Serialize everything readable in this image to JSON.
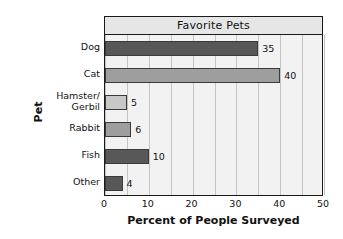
{
  "chart_data": {
    "type": "bar",
    "orientation": "horizontal",
    "title": "Favorite Pets",
    "xlabel": "Percent of People Surveyed",
    "ylabel": "Pet",
    "categories": [
      "Dog",
      "Cat",
      "Hamster/\nGerbil",
      "Rabbit",
      "Fish",
      "Other"
    ],
    "category_lines": [
      [
        "Dog"
      ],
      [
        "Cat"
      ],
      [
        "Hamster/",
        "Gerbil"
      ],
      [
        "Rabbit"
      ],
      [
        "Fish"
      ],
      [
        "Other"
      ]
    ],
    "values": [
      35,
      40,
      5,
      6,
      10,
      4
    ],
    "value_labels": [
      "35",
      "40",
      "5",
      "6",
      "10",
      "4"
    ],
    "bar_colors": [
      "#585858",
      "#9e9e9e",
      "#c8c8c8",
      "#9e9e9e",
      "#585858",
      "#585858"
    ],
    "xlim": [
      0,
      50
    ],
    "xticks": [
      0,
      10,
      20,
      30,
      40,
      50
    ],
    "xtick_labels": [
      "0",
      "10",
      "20",
      "30",
      "40",
      "50"
    ],
    "gridline_step": 5,
    "grid": true,
    "legend": false,
    "plot_background": "#f2f2f2",
    "title_band_background": "#e6e6e6",
    "border_color": "#1a1a1a",
    "gridline_color": "#c4c4c4",
    "bar_edge_color": "#3a3a3a",
    "text_color": "#111111"
  }
}
